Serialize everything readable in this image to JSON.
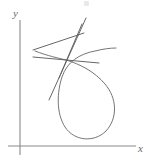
{
  "figure": {
    "kind": "math-plot",
    "caption_visible": false,
    "background_color": "#ffffff",
    "axis_color": "#8a8a8a",
    "curve_color": "#6e6e6e",
    "line_color": "#5f5f5f",
    "axes": {
      "x_label": "x",
      "y_label": "y",
      "origin": {
        "x": 20,
        "y": 146
      },
      "x_axis": {
        "x1": 8,
        "y1": 146,
        "x2": 136,
        "y2": 146
      },
      "y_axis": {
        "x1": 20,
        "y1": 20,
        "x2": 20,
        "y2": 155
      },
      "ticks": [],
      "tick_labels": [],
      "gridlines": false
    }
  },
  "chart_data": {
    "type": "line",
    "title": "",
    "subtitle": "",
    "xlabel": "x",
    "ylabel": "y",
    "xlim": [
      0,
      156
    ],
    "ylim": [
      0,
      164
    ],
    "grid": false,
    "legend": null,
    "annotations": [],
    "node_point": {
      "x": 66,
      "y": 60
    },
    "series": [
      {
        "name": "looped-curve",
        "role": "curve",
        "closed_loop": true,
        "self_intersection": {
          "x": 66,
          "y": 60
        },
        "path": "M 35 51 C 48 56 58 58 66 60 C 80 64 95 72 105 84 C 117 98 118 118 106 131 C 94 143 74 141 65 127 C 56 113 57 92 62 77 C 67 62 79 54 95 51 C 103 49 110 48 116 48",
        "extent": {
          "left": 35,
          "right": 118,
          "top": 48,
          "bottom": 141
        },
        "loop_bottom": {
          "x": 86,
          "y": 139
        },
        "loop_right": {
          "x": 117,
          "y": 104
        }
      },
      {
        "name": "tangent-line-steep",
        "role": "line",
        "path": "M 49 100 L 86 18",
        "slope_desc": "steep up-right"
      },
      {
        "name": "tangent-line-medium",
        "role": "line",
        "path": "M 59 78 L 82 24",
        "slope_desc": "steep up-right inner"
      },
      {
        "name": "secant-line-upper",
        "role": "line",
        "path": "M 33 50 L 84 33",
        "slope_desc": "shallow up-right"
      },
      {
        "name": "secant-line-lower",
        "role": "line",
        "path": "M 33 57 L 99 63",
        "slope_desc": "near-horizontal"
      }
    ]
  },
  "labels": {
    "x": "x",
    "y": "y"
  }
}
